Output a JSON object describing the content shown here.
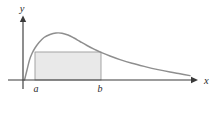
{
  "figure": {
    "title": "",
    "background_color": "#ffffff",
    "width": 220,
    "height": 114
  },
  "axes": {
    "y_axis_label": "y",
    "x_axis_label": "x",
    "axis_color": "#3a3a3a",
    "origin_x": 23,
    "baseline_y": 80
  },
  "tick_labels": {
    "lower_bound": "a",
    "upper_bound": "b"
  },
  "shaded_region": {
    "name": "inscribed-rectangle",
    "fill_color": "#e9e9e9",
    "stroke_color": "#9b9b9b",
    "left_x": 35,
    "right_x": 101,
    "top_y": 52,
    "bottom_y": 80
  },
  "chart_data": {
    "type": "line",
    "title": "",
    "xlabel": "x",
    "ylabel": "y",
    "grid": false,
    "legend": null,
    "curve_color": "#8e8e8e",
    "xlim": [
      0,
      220
    ],
    "ylim": [
      0,
      80
    ],
    "annotations": [
      "a",
      "b",
      "x",
      "y"
    ],
    "series": [
      {
        "name": "density-curve",
        "points": [
          [
            24.5,
            80.0
          ],
          [
            27.0,
            70.0
          ],
          [
            29.5,
            60.0
          ],
          [
            32.0,
            53.5
          ],
          [
            35.0,
            48.0
          ],
          [
            39.0,
            42.5
          ],
          [
            44.0,
            37.5
          ],
          [
            50.0,
            34.5
          ],
          [
            56.0,
            33.0
          ],
          [
            62.0,
            33.2
          ],
          [
            68.0,
            35.0
          ],
          [
            74.0,
            38.0
          ],
          [
            80.0,
            41.5
          ],
          [
            87.0,
            45.5
          ],
          [
            94.0,
            49.2
          ],
          [
            101.0,
            52.4
          ],
          [
            110.0,
            56.0
          ],
          [
            120.0,
            59.6
          ],
          [
            132.0,
            63.3
          ],
          [
            145.0,
            66.6
          ],
          [
            158.0,
            69.6
          ],
          [
            170.0,
            72.0
          ],
          [
            180.0,
            73.8
          ],
          [
            190.0,
            75.6
          ]
        ]
      },
      {
        "name": "rectangle-outline",
        "points": [
          [
            35.0,
            80.0
          ],
          [
            35.0,
            52.0
          ],
          [
            101.0,
            52.0
          ],
          [
            101.0,
            80.0
          ]
        ]
      }
    ]
  }
}
